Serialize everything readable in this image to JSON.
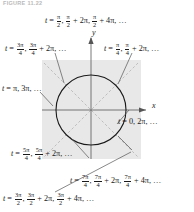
{
  "figure": {
    "caption": "FIGURE 11.22",
    "type": "unit-circle-parameter-diagram"
  },
  "axes": {
    "x_label": "x",
    "y_label": "y"
  },
  "geometry": {
    "shade_color": "#e8e8e8",
    "circle_color": "#1a1a1a",
    "axis_color": "#555555",
    "dashed_color": "#aaaaaa",
    "leader_color": "#555555",
    "center_x": 91,
    "center_y": 110,
    "circle_radius": 35,
    "shade_left": 42,
    "shade_top": 60,
    "shade_size": 99
  },
  "labels": {
    "top": {
      "name": "t-equals-pi-over-2",
      "angle_deg": 90,
      "parts": [
        {
          "type": "text",
          "value": "t"
        },
        {
          "type": "text",
          "value": " = "
        },
        {
          "type": "frac",
          "num": "π",
          "den": "2"
        },
        {
          "type": "text",
          "value": ", "
        },
        {
          "type": "frac",
          "num": "π",
          "den": "2"
        },
        {
          "type": "text",
          "value": " + 2π, "
        },
        {
          "type": "frac",
          "num": "π",
          "den": "2"
        },
        {
          "type": "text",
          "value": " + 4π, …"
        }
      ]
    },
    "upper_left": {
      "name": "t-equals-3pi-over-4",
      "angle_deg": 135,
      "parts": [
        {
          "type": "text",
          "value": "t"
        },
        {
          "type": "text",
          "value": " = "
        },
        {
          "type": "frac",
          "num": "3π",
          "den": "4"
        },
        {
          "type": "text",
          "value": ", "
        },
        {
          "type": "frac",
          "num": "3π",
          "den": "4"
        },
        {
          "type": "text",
          "value": " + 2π, …"
        }
      ]
    },
    "upper_right": {
      "name": "t-equals-pi-over-4",
      "angle_deg": 45,
      "parts": [
        {
          "type": "text",
          "value": "t"
        },
        {
          "type": "text",
          "value": " = "
        },
        {
          "type": "frac",
          "num": "π",
          "den": "4"
        },
        {
          "type": "text",
          "value": ", "
        },
        {
          "type": "frac",
          "num": "π",
          "den": "4"
        },
        {
          "type": "text",
          "value": " + 2π, …"
        }
      ]
    },
    "left": {
      "name": "t-equals-pi",
      "angle_deg": 180,
      "parts": [
        {
          "type": "text",
          "value": "t"
        },
        {
          "type": "text",
          "value": " = π, 3π, …"
        }
      ]
    },
    "right": {
      "name": "t-equals-zero",
      "angle_deg": 0,
      "parts": [
        {
          "type": "text",
          "value": "t"
        },
        {
          "type": "text",
          "value": " = 0, 2π, …"
        }
      ]
    },
    "lower_left": {
      "name": "t-equals-5pi-over-4",
      "angle_deg": 225,
      "parts": [
        {
          "type": "text",
          "value": "t"
        },
        {
          "type": "text",
          "value": " = "
        },
        {
          "type": "frac",
          "num": "5π",
          "den": "4"
        },
        {
          "type": "text",
          "value": ", "
        },
        {
          "type": "frac",
          "num": "5π",
          "den": "4"
        },
        {
          "type": "text",
          "value": " + 2π, …"
        }
      ]
    },
    "lower_right": {
      "name": "t-equals-7pi-over-4",
      "angle_deg": 315,
      "parts": [
        {
          "type": "text",
          "value": "t"
        },
        {
          "type": "text",
          "value": " = "
        },
        {
          "type": "frac",
          "num": "7π",
          "den": "4"
        },
        {
          "type": "text",
          "value": ", "
        },
        {
          "type": "frac",
          "num": "7π",
          "den": "4"
        },
        {
          "type": "text",
          "value": " + 2π, "
        },
        {
          "type": "frac",
          "num": "7π",
          "den": "4"
        },
        {
          "type": "text",
          "value": " + 4π, …"
        }
      ]
    },
    "bottom": {
      "name": "t-equals-3pi-over-2",
      "angle_deg": 270,
      "parts": [
        {
          "type": "text",
          "value": "t"
        },
        {
          "type": "text",
          "value": " = "
        },
        {
          "type": "frac",
          "num": "3π",
          "den": "2"
        },
        {
          "type": "text",
          "value": ", "
        },
        {
          "type": "frac",
          "num": "3π",
          "den": "2"
        },
        {
          "type": "text",
          "value": " + 2π, "
        },
        {
          "type": "frac",
          "num": "3π",
          "den": "2"
        },
        {
          "type": "text",
          "value": " + 4π, …"
        }
      ]
    }
  }
}
